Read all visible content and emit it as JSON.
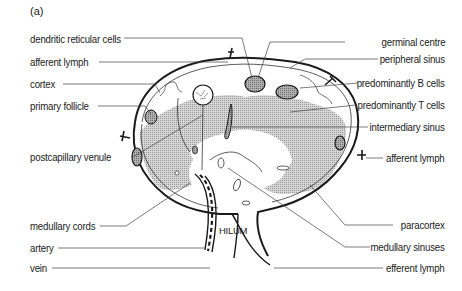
{
  "panel_label": "(a)",
  "hilum_label": "HILUM",
  "labels_left": [
    {
      "id": "dendritic-reticular-cells",
      "text": "dendritic reticular cells",
      "x": 30,
      "y": 33
    },
    {
      "id": "afferent-lymph-left",
      "text": "afferent lymph",
      "x": 30,
      "y": 56
    },
    {
      "id": "cortex",
      "text": "cortex",
      "x": 30,
      "y": 78
    },
    {
      "id": "primary-follicle",
      "text": "primary follicle",
      "x": 30,
      "y": 100
    },
    {
      "id": "postcapillary-venule",
      "text": "postcapillary venule",
      "x": 30,
      "y": 151
    },
    {
      "id": "medullary-cords",
      "text": "medullary cords",
      "x": 30,
      "y": 220
    },
    {
      "id": "artery",
      "text": "artery",
      "x": 30,
      "y": 241
    },
    {
      "id": "vein",
      "text": "vein",
      "x": 30,
      "y": 262
    }
  ],
  "labels_right": [
    {
      "id": "germinal-centre",
      "text": "germinal centre",
      "right": 17,
      "y": 36
    },
    {
      "id": "peripheral-sinus",
      "text": "peripheral sinus",
      "right": 17,
      "y": 53
    },
    {
      "id": "predominantly-b-cells",
      "text": "predominantly B cells",
      "right": 17,
      "y": 77
    },
    {
      "id": "predominantly-t-cells",
      "text": "predominantly T cells",
      "right": 17,
      "y": 99
    },
    {
      "id": "intermediary-sinus",
      "text": "intermediary sinus",
      "right": 17,
      "y": 121
    },
    {
      "id": "afferent-lymph-right",
      "text": "afferent lymph",
      "right": 17,
      "y": 152
    },
    {
      "id": "paracortex",
      "text": "paracortex",
      "right": 17,
      "y": 219
    },
    {
      "id": "medullary-sinuses",
      "text": "medullary sinuses",
      "right": 17,
      "y": 241
    },
    {
      "id": "efferent-lymph",
      "text": "efferent lymph",
      "right": 17,
      "y": 262
    }
  ],
  "colors": {
    "outline": "#1a1a1a",
    "shade": "#bdbdbd",
    "leader": "#444444"
  }
}
